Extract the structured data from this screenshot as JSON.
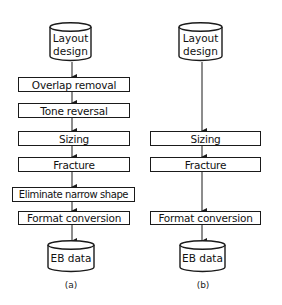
{
  "diagram": {
    "flow_a": {
      "caption": "(a)",
      "start": {
        "line1": "Layout",
        "line2": "design"
      },
      "steps": [
        "Overlap removal",
        "Tone reversal",
        "Sizing",
        "Fracture",
        "Eliminate narrow shape",
        "Format conversion"
      ],
      "end": {
        "label": "EB data"
      }
    },
    "flow_b": {
      "caption": "(b)",
      "start": {
        "line1": "Layout",
        "line2": "design"
      },
      "steps": [
        "Sizing",
        "Fracture",
        "Format conversion"
      ],
      "end": {
        "label": "EB data"
      }
    },
    "colors": {
      "line": "#1a1a1a",
      "background": "#ffffff",
      "text": "#111111"
    }
  }
}
